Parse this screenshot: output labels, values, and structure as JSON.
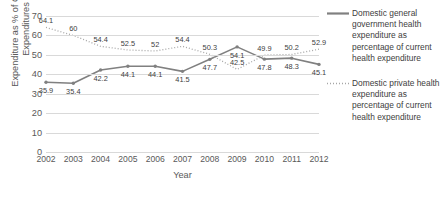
{
  "chart_data": {
    "type": "line",
    "title": "",
    "xlabel": "Year",
    "ylabel": "Expenditure as % of Current Expenditures",
    "ylabel_line1": "Expenditure as % of Current",
    "ylabel_line2": "Expenditures",
    "categories": [
      "2002",
      "2003",
      "2004",
      "2005",
      "2006",
      "2007",
      "2008",
      "2009",
      "2010",
      "2011",
      "2012"
    ],
    "yticks": [
      70,
      60,
      50,
      40,
      30,
      20,
      10,
      0
    ],
    "ylim": [
      0,
      70
    ],
    "grid": true,
    "legend_position": "right",
    "series": [
      {
        "name": "Domestic general government health expenditure as percentage of current health expenditure",
        "style": "solid",
        "color": "#808080",
        "values": [
          35.9,
          35.4,
          42.2,
          44.1,
          44.1,
          41.5,
          47.7,
          54.1,
          47.8,
          48.3,
          45.1
        ],
        "labels": [
          "35.9",
          "35.4",
          "42.2",
          "44.1",
          "44.1",
          "41.5",
          "47.7",
          "54.1",
          "47.8",
          "48.3",
          "45.1"
        ]
      },
      {
        "name": "Domestic private health expenditure as percentage of current health expenditure",
        "style": "dotted",
        "color": "#a6a6a6",
        "values": [
          64.1,
          60.0,
          54.4,
          52.5,
          52.0,
          54.4,
          50.3,
          42.5,
          49.9,
          50.2,
          52.9
        ],
        "labels": [
          "64.1",
          "60",
          "54.4",
          "52.5",
          "52",
          "54.4",
          "50.3",
          "42.5",
          "49.9",
          "50.2",
          "52.9"
        ]
      }
    ]
  },
  "legend": {
    "items": [
      {
        "label": "Domestic general government health expenditure as percentage of current health expenditure",
        "style": "solid",
        "color": "#808080"
      },
      {
        "label": "Domestic private health expenditure as percentage of current health expenditure",
        "style": "dotted",
        "color": "#a6a6a6"
      }
    ]
  }
}
